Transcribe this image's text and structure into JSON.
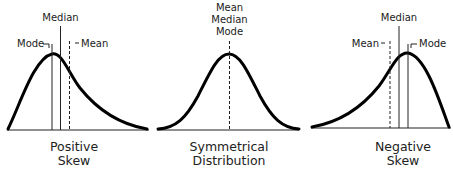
{
  "colors": {
    "background": "#ffffff",
    "curve": "#000000",
    "lines": "#222222",
    "text": "#222222"
  },
  "panels": [
    {
      "id": "positive-skew",
      "caption": [
        "Positive",
        "Skew"
      ],
      "labels": {
        "mode": "Mode",
        "median": "Median",
        "mean": "Mean"
      }
    },
    {
      "id": "symmetrical",
      "caption": [
        "Symmetrical",
        "Distribution"
      ],
      "labels": {
        "mean": "Mean",
        "median": "Median",
        "mode": "Mode"
      }
    },
    {
      "id": "negative-skew",
      "caption": [
        "Negative",
        "Skew"
      ],
      "labels": {
        "mean": "Mean",
        "median": "Median",
        "mode": "Mode"
      }
    }
  ]
}
